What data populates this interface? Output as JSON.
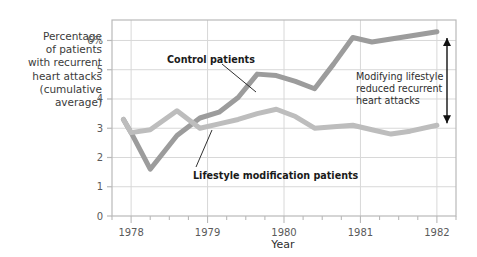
{
  "chart_data": {
    "type": "line",
    "title": "",
    "xlabel": "Year",
    "ylabel": "Percentage\nof patients\nwith recurrent\nheart attacks\n(cumulative\naverage)",
    "xlim": [
      1977.75,
      1982.25
    ],
    "ylim": [
      0,
      6.7
    ],
    "grid": true,
    "legend_position": "inline-annotations",
    "xticks": [
      1978,
      1979,
      1980,
      1981,
      1982
    ],
    "xtick_labels": [
      "1978",
      "1979",
      "1980",
      "1981",
      "1982"
    ],
    "xminor_tick_step": 0.25,
    "yticks": [
      0,
      1,
      2,
      3,
      4,
      5,
      6
    ],
    "ytick_labels": [
      "0",
      "1",
      "2",
      "3",
      "4",
      "5",
      "6%"
    ],
    "series": [
      {
        "name": "Control patients",
        "color": "#9c9c9c",
        "x": [
          1977.9,
          1978.0,
          1978.25,
          1978.6,
          1978.9,
          1979.15,
          1979.4,
          1979.65,
          1979.9,
          1980.15,
          1980.4,
          1980.65,
          1980.9,
          1981.15,
          1981.4,
          1981.65,
          1982.0
        ],
        "values": [
          3.3,
          2.85,
          1.6,
          2.75,
          3.35,
          3.55,
          4.05,
          4.85,
          4.8,
          4.6,
          4.35,
          5.2,
          6.1,
          5.95,
          6.05,
          6.15,
          6.3
        ]
      },
      {
        "name": "Lifestyle modification patients",
        "color": "#bdbdbd",
        "x": [
          1977.9,
          1978.0,
          1978.25,
          1978.6,
          1978.9,
          1979.15,
          1979.4,
          1979.65,
          1979.9,
          1980.15,
          1980.4,
          1980.65,
          1980.9,
          1981.15,
          1981.4,
          1981.65,
          1982.0
        ],
        "values": [
          3.3,
          2.85,
          2.95,
          3.6,
          3.0,
          3.15,
          3.3,
          3.5,
          3.65,
          3.4,
          3.0,
          3.05,
          3.1,
          2.95,
          2.8,
          2.9,
          3.1
        ]
      }
    ],
    "annotations": [
      {
        "name": "control-patients-callout",
        "text": "Control patients",
        "type": "leader-label"
      },
      {
        "name": "lifestyle-modification-callout",
        "text": "Lifestyle modification patients",
        "type": "leader-label"
      },
      {
        "name": "gap-note",
        "lines": [
          "Modifying lifestyle",
          "reduced recurrent",
          "heart attacks"
        ],
        "type": "note"
      },
      {
        "name": "gap-arrow",
        "type": "double-headed-arrow",
        "from_value": 6.15,
        "to_value": 3.1
      }
    ],
    "colors": {
      "background": "#ffffff",
      "frame": "#b9b9b9",
      "grid": "#d8d8d8",
      "tick_text": "#5a5a5a",
      "label_text": "#3b3b3b",
      "annotation_text": "#1a1a1a",
      "arrow": "#111111"
    }
  }
}
